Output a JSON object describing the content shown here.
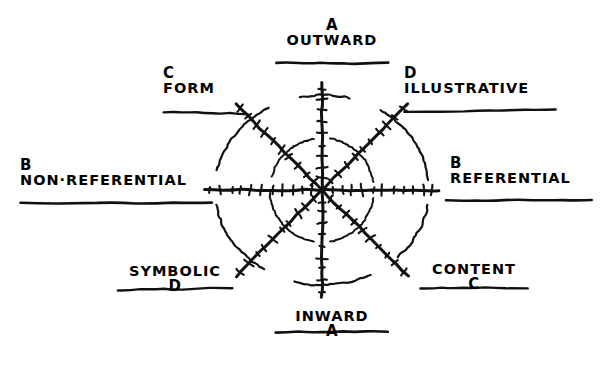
{
  "figure": {
    "kind": "hand-drawn polar diagram",
    "axis_count": 4,
    "ring_count": 2,
    "ink_color": "#111111",
    "paper_color": "#ffffff"
  },
  "labels": {
    "outward": {
      "word": "OUTWARD",
      "code": "A",
      "code_position": "above"
    },
    "inward": {
      "word": "INWARD",
      "code": "A",
      "code_position": "below"
    },
    "non_referential": {
      "word": "NON·REFERENTIAL",
      "code": "B",
      "code_position": "above"
    },
    "referential": {
      "word": "REFERENTIAL",
      "code": "B",
      "code_position": "above"
    },
    "form": {
      "word": "FORM",
      "code": "C",
      "code_position": "above"
    },
    "content": {
      "word": "CONTENT",
      "code": "C",
      "code_position": "below"
    },
    "illustrative": {
      "word": "ILLUSTRATIVE",
      "code": "D",
      "code_position": "above"
    },
    "symbolic": {
      "word": "SYMBOLIC",
      "code": "D",
      "code_position": "below"
    }
  },
  "chart_data": {
    "type": "scatter",
    "title": "",
    "xlabel": "",
    "ylabel": "",
    "grid": true,
    "legend": null,
    "center": {
      "x": 322,
      "y": 190
    },
    "rings": [
      {
        "name": "inner",
        "rx": 52,
        "ry": 52
      },
      {
        "name": "outer",
        "rx": 107,
        "ry": 95
      }
    ],
    "axes": [
      {
        "name": "vertical",
        "angle_deg": 90,
        "pos_label": "OUTWARD",
        "neg_label": "INWARD",
        "code": "A",
        "ticks_positive": 9,
        "ticks_negative": 9
      },
      {
        "name": "horizontal",
        "angle_deg": 0,
        "pos_label": "REFERENTIAL",
        "neg_label": "NON·REFERENTIAL",
        "code": "B",
        "ticks_positive": 11,
        "ticks_negative": 11
      },
      {
        "name": "diagonal-nw",
        "angle_deg": 135,
        "pos_label": "FORM",
        "neg_label": "CONTENT",
        "code": "C",
        "ticks_positive": 10,
        "ticks_negative": 10
      },
      {
        "name": "diagonal-ne",
        "angle_deg": 45,
        "pos_label": "ILLUSTRATIVE",
        "neg_label": "SYMBOLIC",
        "code": "D",
        "ticks_positive": 10,
        "ticks_negative": 10
      }
    ]
  }
}
